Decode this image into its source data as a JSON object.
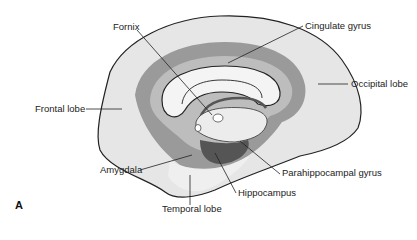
{
  "figure": {
    "panel_label": "A",
    "labels": {
      "fornix": "Fornix",
      "cingulate_gyrus": "Cingulate gyrus",
      "occipital_lobe": "Occipital lobe",
      "frontal_lobe": "Frontal lobe",
      "amygdala": "Amygdala",
      "parahippocampal_gyrus": "Parahippocampal gyrus",
      "hippocampus": "Hippocampus",
      "temporal_lobe": "Temporal lobe"
    },
    "colors": {
      "cortex": "#e6e6e6",
      "limbic_band": "#9a9a9a",
      "inner_band": "#bdbdbd",
      "corpus_callosum": "#f4f4f4",
      "hippocampus": "#555555",
      "outline": "#222222"
    }
  }
}
